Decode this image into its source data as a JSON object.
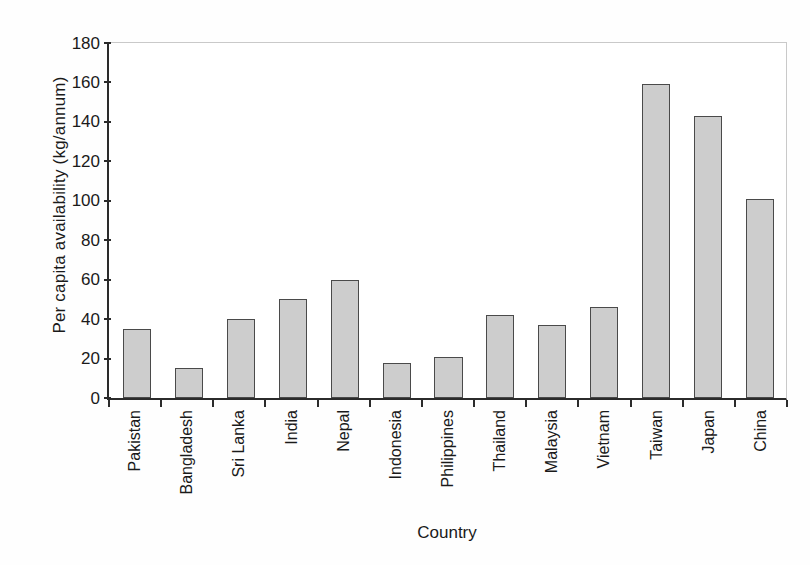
{
  "chart_data": {
    "type": "bar",
    "title": "",
    "xlabel": "Country",
    "ylabel": "Per capita availability (kg/annum)",
    "categories": [
      "Pakistan",
      "Bangladesh",
      "Sri Lanka",
      "India",
      "Nepal",
      "Indonesia",
      "Philippines",
      "Thailand",
      "Malaysia",
      "Vietnam",
      "Taiwan",
      "Japan",
      "China"
    ],
    "values": [
      35,
      15,
      40,
      50,
      60,
      18,
      21,
      42,
      37,
      46,
      159,
      143,
      101
    ],
    "ylim": [
      0,
      180
    ],
    "yticks": [
      0,
      20,
      40,
      60,
      80,
      100,
      120,
      140,
      160,
      180
    ],
    "ytick_labels": [
      "0",
      "20",
      "40",
      "60",
      "80",
      "100",
      "120",
      "140",
      "160",
      "180"
    ],
    "grid": false,
    "legend": null,
    "bar_fill_color": "#cdcdcd",
    "bar_edge_color": "#4a4a4a",
    "axis_color": "#2b2b2b"
  }
}
